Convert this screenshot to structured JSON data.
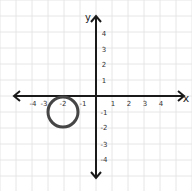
{
  "diagram": {
    "type": "coordinate-plane",
    "x_axis_label": "x",
    "y_axis_label": "y",
    "x_ticks": [
      {
        "value": -4,
        "label": "-4"
      },
      {
        "value": -3,
        "label": "-3"
      },
      {
        "value": -2,
        "label": "-2"
      },
      {
        "value": -1,
        "label": "-1"
      },
      {
        "value": 1,
        "label": "1"
      },
      {
        "value": 2,
        "label": "2"
      },
      {
        "value": 3,
        "label": "3"
      },
      {
        "value": 4,
        "label": "4"
      }
    ],
    "y_ticks": [
      {
        "value": 4,
        "label": "4"
      },
      {
        "value": 3,
        "label": "3"
      },
      {
        "value": 2,
        "label": "2"
      },
      {
        "value": 1,
        "label": "1"
      },
      {
        "value": -1,
        "label": "-1"
      },
      {
        "value": -2,
        "label": "-2"
      },
      {
        "value": -3,
        "label": "-3"
      },
      {
        "value": -4,
        "label": "-4"
      }
    ],
    "circle": {
      "center_x": -2,
      "center_y": -1,
      "radius": 1,
      "stroke": "#454545"
    },
    "colors": {
      "grid": "#e6e6e6",
      "axis": "#1a1a1a",
      "background": "#ffffff"
    }
  }
}
